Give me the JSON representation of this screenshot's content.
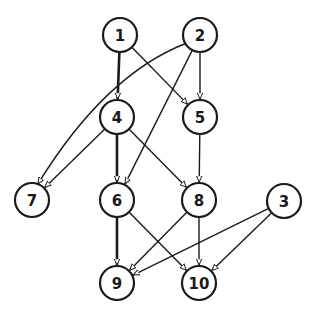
{
  "diagram": {
    "type": "directed-acyclic-graph",
    "node_radius": 17,
    "colors": {
      "stroke": "#1a1a1a",
      "fill": "#ffffff",
      "background": "#ffffff"
    },
    "nodes": [
      {
        "id": "1",
        "label": "1",
        "x": 120,
        "y": 35
      },
      {
        "id": "2",
        "label": "2",
        "x": 200,
        "y": 35
      },
      {
        "id": "3",
        "label": "3",
        "x": 284,
        "y": 201
      },
      {
        "id": "4",
        "label": "4",
        "x": 117,
        "y": 117
      },
      {
        "id": "5",
        "label": "5",
        "x": 200,
        "y": 117
      },
      {
        "id": "6",
        "label": "6",
        "x": 117,
        "y": 200
      },
      {
        "id": "7",
        "label": "7",
        "x": 32,
        "y": 200
      },
      {
        "id": "8",
        "label": "8",
        "x": 199,
        "y": 200
      },
      {
        "id": "9",
        "label": "9",
        "x": 117,
        "y": 283
      },
      {
        "id": "10",
        "label": "10",
        "x": 199,
        "y": 283
      }
    ],
    "edges": [
      {
        "from": "1",
        "to": "4",
        "thick": true
      },
      {
        "from": "1",
        "to": "5",
        "thick": false
      },
      {
        "from": "2",
        "to": "5",
        "thick": false
      },
      {
        "from": "2",
        "to": "6",
        "thick": false
      },
      {
        "from": "2",
        "to": "7",
        "thick": false,
        "curved": true
      },
      {
        "from": "4",
        "to": "7",
        "thick": false
      },
      {
        "from": "4",
        "to": "6",
        "thick": true
      },
      {
        "from": "4",
        "to": "8",
        "thick": false
      },
      {
        "from": "5",
        "to": "8",
        "thick": false
      },
      {
        "from": "6",
        "to": "9",
        "thick": true
      },
      {
        "from": "6",
        "to": "10",
        "thick": false
      },
      {
        "from": "8",
        "to": "9",
        "thick": false
      },
      {
        "from": "8",
        "to": "10",
        "thick": false
      },
      {
        "from": "3",
        "to": "9",
        "thick": false
      },
      {
        "from": "3",
        "to": "10",
        "thick": false
      }
    ]
  }
}
